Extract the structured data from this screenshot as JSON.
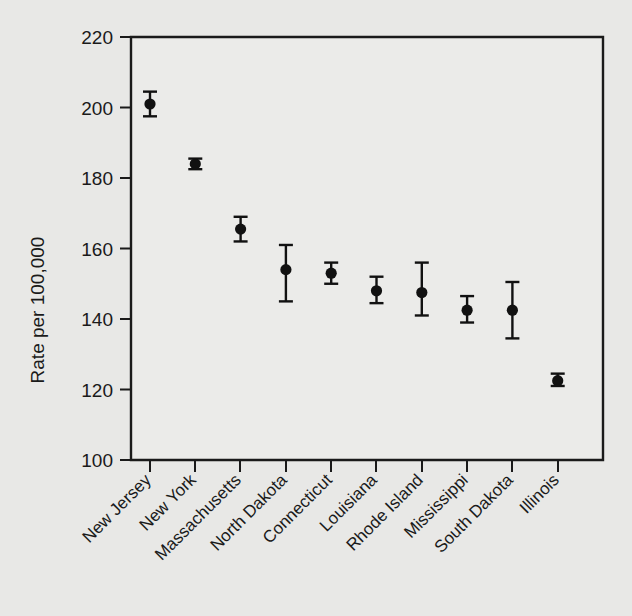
{
  "chart_data": {
    "type": "scatter",
    "title": "",
    "subtitle": "",
    "xlabel": "",
    "ylabel": "Rate per 100,000",
    "ylim": [
      100,
      220
    ],
    "yticks": [
      100,
      120,
      140,
      160,
      180,
      200,
      220
    ],
    "ytick_labels": [
      "100",
      "120",
      "140",
      "160",
      "180",
      "200",
      "220"
    ],
    "grid": false,
    "legend": null,
    "error_bars": "vertical 95% confidence intervals with caps",
    "categories": [
      "New Jersey",
      "New York",
      "Massachusetts",
      "North Dakota",
      "Connecticut",
      "Louisiana",
      "Rhode Island",
      "Mississippi",
      "South Dakota",
      "Illinois"
    ],
    "values": [
      201.0,
      184.0,
      165.5,
      154.0,
      153.0,
      148.0,
      147.5,
      142.5,
      142.5,
      122.5
    ],
    "ci_lower": [
      197.5,
      182.5,
      162.0,
      145.0,
      150.0,
      144.5,
      141.0,
      139.0,
      134.5,
      121.0
    ],
    "ci_upper": [
      204.5,
      185.5,
      169.0,
      161.0,
      156.0,
      152.0,
      156.0,
      146.5,
      150.5,
      124.5
    ],
    "series": [
      {
        "name": "Rate per 100,000",
        "values": [
          201.0,
          184.0,
          165.5,
          154.0,
          153.0,
          148.0,
          147.5,
          142.5,
          142.5,
          122.5
        ]
      }
    ]
  },
  "colors": {
    "background": "#e8e8e6",
    "plot_background": "#ebebe9",
    "marker": "#111111",
    "axis": "#1a1a1a",
    "text": "#1a1a1a"
  }
}
